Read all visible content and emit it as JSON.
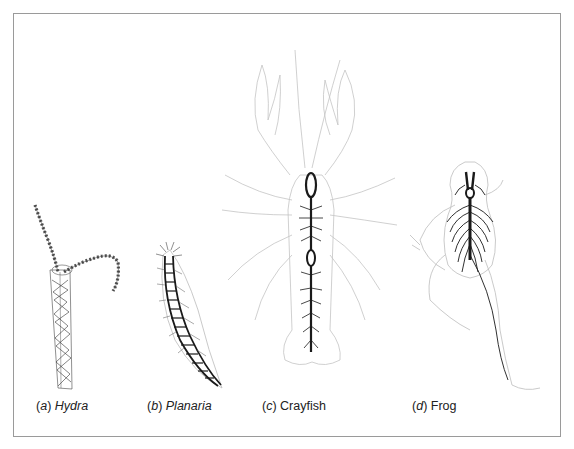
{
  "figure": {
    "panels": [
      {
        "letter": "a",
        "name": "Hydra",
        "name_italic": true,
        "nervous_system": "nerve-net"
      },
      {
        "letter": "b",
        "name": "Planaria",
        "name_italic": true,
        "nervous_system": "ladder-like-nerve-cords"
      },
      {
        "letter": "c",
        "name": "Crayfish",
        "name_italic": false,
        "nervous_system": "ventral-nerve-cord-with-ganglia"
      },
      {
        "letter": "d",
        "name": "Frog",
        "name_italic": false,
        "nervous_system": "central-brain-and-spinal-cord"
      }
    ],
    "colors": {
      "outline": "#b5b5b5",
      "nerve": "#1a1a1a",
      "frame": "#9a9a9a",
      "text": "#222222"
    }
  }
}
